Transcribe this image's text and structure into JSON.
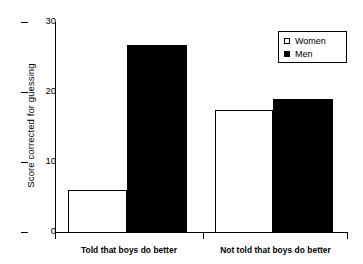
{
  "chart_data": {
    "type": "bar",
    "title": "",
    "subtitle": "",
    "xlabel": "",
    "ylabel": "Score corrected for guessing",
    "categories": [
      "Told that boys do better",
      "Not told that boys do better"
    ],
    "series": [
      {
        "name": "Women",
        "values": [
          6.0,
          17.4
        ],
        "style": "open",
        "color": "#ffffff",
        "edge_color": "#000000"
      },
      {
        "name": "Men",
        "values": [
          26.7,
          19.0
        ],
        "style": "filled",
        "color": "#000000",
        "edge_color": "#000000"
      }
    ],
    "ylim": [
      0,
      30
    ],
    "yticks": [
      0,
      10,
      20,
      30
    ],
    "ytick_labels": [
      "0",
      "10",
      "20",
      "30"
    ],
    "grid": false,
    "legend_position": "top-right",
    "background": "#ffffff",
    "axis_color": "#000000"
  },
  "legend": {
    "entries": [
      {
        "label": "Women",
        "marker": "open-square"
      },
      {
        "label": "Men",
        "marker": "filled-square"
      }
    ]
  },
  "axes": {
    "y_title": "Score corrected for guessing",
    "y_labels": [
      "30",
      "20",
      "10",
      "0"
    ],
    "x_labels": [
      "Told that boys do better",
      "Not told that boys do better"
    ]
  }
}
